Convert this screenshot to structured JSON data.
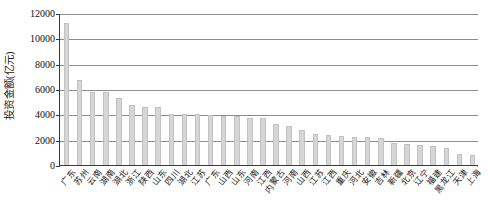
{
  "chart_data": {
    "type": "bar",
    "title": "",
    "subtitle": "",
    "xlabel": "",
    "ylabel": "投资金额(亿元)",
    "ylim": [
      0,
      12000
    ],
    "ytick_values": [
      0,
      2000,
      4000,
      6000,
      8000,
      10000,
      12000
    ],
    "ytick_labels": [
      "0",
      "2000",
      "4000",
      "6000",
      "8000",
      "10000",
      "12000"
    ],
    "grid": "horizontal",
    "legend": "none",
    "bar_color": "#d6d6d6",
    "bar_edge_color": "#c2c2c2",
    "axis_color": "#3a3a3a",
    "grid_color": "#8d8d8d",
    "categories": [
      "广东",
      "苏州",
      "云南",
      "湖南",
      "湖北",
      "浙江",
      "陕西",
      "山东",
      "四川",
      "湖北",
      "江苏",
      "广东",
      "山西",
      "山东",
      "河南",
      "江西",
      "内蒙古",
      "河南",
      "山西",
      "江苏",
      "江西",
      "重庆",
      "河北",
      "安徽",
      "吉林",
      "新疆",
      "北京",
      "辽宁",
      "福建",
      "黑龙江",
      "天津",
      "上海"
    ],
    "values": [
      11200,
      6700,
      5800,
      5750,
      5300,
      4700,
      4600,
      4550,
      4050,
      4050,
      4000,
      3950,
      3900,
      3850,
      3750,
      3700,
      3200,
      3100,
      2750,
      2450,
      2400,
      2300,
      2250,
      2200,
      2150,
      1700,
      1650,
      1600,
      1500,
      1350,
      900,
      800
    ],
    "series_name": "投资金额"
  }
}
